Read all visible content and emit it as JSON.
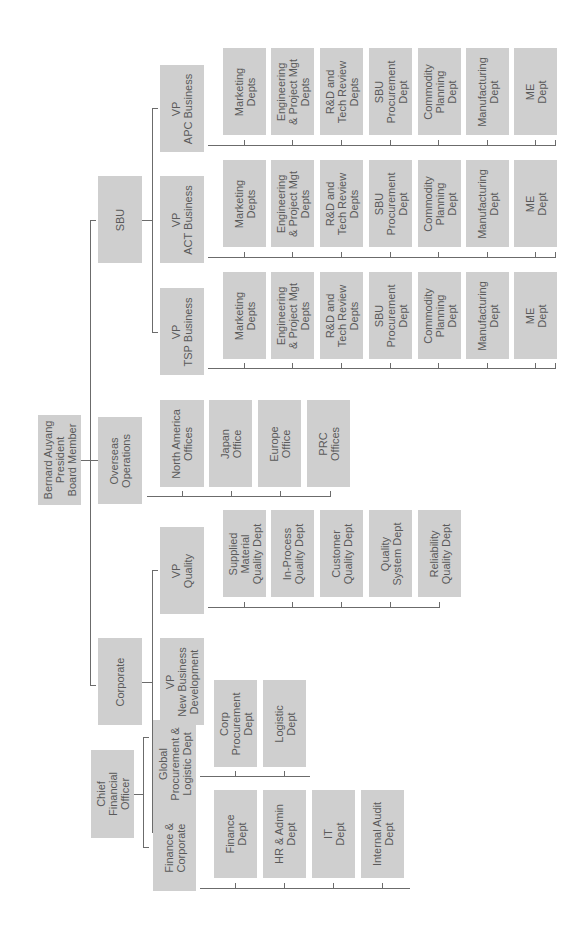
{
  "chart_title": "",
  "root": {
    "label": "Bernard Auyang\nPresident\nBoard Member"
  },
  "level1": {
    "sbu": "SBU",
    "overseas": "Overseas\nOperations",
    "corporate": "Corporate"
  },
  "sbu": {
    "vps": [
      {
        "label": "VP\nAPC Business"
      },
      {
        "label": "VP\nACT Business"
      },
      {
        "label": "VP\nTSP Business"
      }
    ],
    "depts": [
      "Marketing\nDepts",
      "Engineering\n& Project Mgt\nDepts",
      "R&D and\nTech Review\nDepts",
      "SBU\nProcurement\nDept",
      "Commodity\nPlanning\nDept",
      "Manufacturing\nDept",
      "ME\nDept"
    ]
  },
  "overseas": {
    "offices": [
      "North America\nOffices",
      "Japan\nOffice",
      "Europe\nOffice",
      "PRC\nOffices"
    ]
  },
  "corporate": {
    "vp_quality": "VP\nQuality",
    "quality_depts": [
      "Supplied\nMaterial\nQuality Dept",
      "In-Process\nQuality Dept",
      "Customer\nQuality Dept",
      "Quality\nSystem Dept",
      "Reliability\nQuality Dept"
    ],
    "vp_nbd": "VP\nNew Business\nDevelopment",
    "cfo": "Chief\nFinancial\nOfficer",
    "global_proc": "Global\nProcurement &\nLogistic Dept",
    "global_proc_depts": [
      "Corp\nProcurement\nDept",
      "Logistic\nDept"
    ],
    "fin_corp": "Finance &\nCorporate",
    "fin_corp_depts": [
      "Finance\nDept",
      "HR & Admin\nDept",
      "IT\nDept",
      "Internal Audit\nDept"
    ]
  },
  "colors": {
    "box": "#cfcfcf",
    "text": "#5a5a5a",
    "line": "#6b6b6b",
    "background": "#ffffff"
  }
}
